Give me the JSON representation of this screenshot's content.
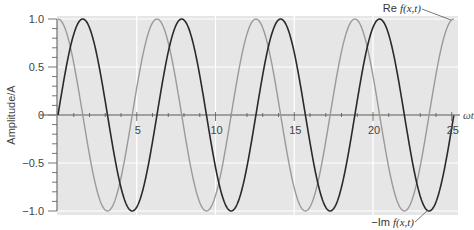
{
  "chart_data": {
    "type": "line",
    "title": "",
    "xlabel": "ωt",
    "ylabel": "Amplitude/A",
    "xlim": [
      0,
      25.5
    ],
    "ylim": [
      -1.0,
      1.0
    ],
    "x_ticks": [
      5,
      10,
      15,
      20,
      25
    ],
    "x_tick_labels": [
      "5",
      "10",
      "15",
      "20",
      "25"
    ],
    "y_ticks": [
      -1.0,
      -0.5,
      0,
      0.5,
      1.0
    ],
    "y_tick_labels": [
      "−1.0",
      "−0.5",
      "0",
      "0.5",
      "1.0"
    ],
    "grid": true,
    "background": "#e6e6e6",
    "x_range_of_curves": [
      0,
      25.13
    ],
    "series": [
      {
        "name": "Re f(x,t)",
        "function": "cos(ωt)",
        "color": "#9a9a9a",
        "x": [
          0,
          1.571,
          3.142,
          4.712,
          6.283,
          7.854,
          9.425,
          10.996,
          12.566,
          14.137,
          15.708,
          17.279,
          18.85,
          20.42,
          21.991,
          23.562,
          25.133
        ],
        "values": [
          1,
          0,
          -1,
          0,
          1,
          0,
          -1,
          0,
          1,
          0,
          -1,
          0,
          1,
          0,
          -1,
          0,
          1
        ]
      },
      {
        "name": "−Im f(x,t)",
        "function": "sin(ωt)",
        "color": "#2a2a2a",
        "x": [
          0,
          1.571,
          3.142,
          4.712,
          6.283,
          7.854,
          9.425,
          10.996,
          12.566,
          14.137,
          15.708,
          17.279,
          18.85,
          20.42,
          21.991,
          23.562,
          25.133
        ],
        "values": [
          0,
          1,
          0,
          -1,
          0,
          1,
          0,
          -1,
          0,
          1,
          0,
          -1,
          0,
          1,
          0,
          -1,
          0
        ]
      }
    ],
    "annotations": [
      {
        "text": "Re f(x,t)",
        "prefix": "Re ",
        "expr": "f(x,t)",
        "target_series": "Re f(x,t)",
        "position": "top-right"
      },
      {
        "text": "−Im f(x,t)",
        "prefix": "−Im ",
        "expr": "f(x,t)",
        "target_series": "−Im f(x,t)",
        "position": "bottom-right"
      }
    ]
  }
}
